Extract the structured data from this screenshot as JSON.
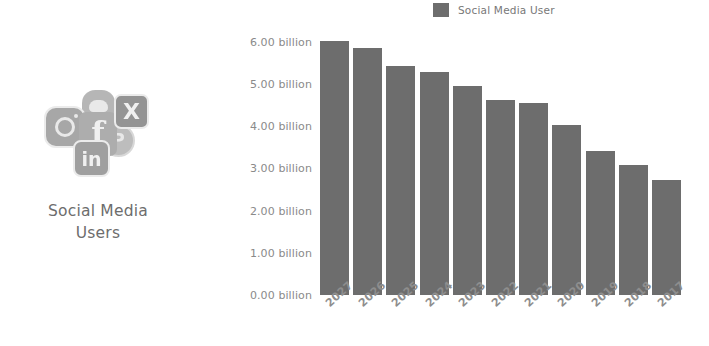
{
  "left_panel": {
    "caption_line1": "Social Media",
    "caption_line2": "Users",
    "icons": [
      {
        "name": "instagram-icon",
        "glyph": ""
      },
      {
        "name": "facebook-icon",
        "glyph": "f"
      },
      {
        "name": "snapchat-icon",
        "glyph": ""
      },
      {
        "name": "x-twitter-icon",
        "glyph": "X"
      },
      {
        "name": "linkedin-icon",
        "glyph": "in"
      },
      {
        "name": "pinterest-icon",
        "glyph": "P"
      }
    ]
  },
  "legend": {
    "label": "Social Media User",
    "swatch_color": "#6d6d6d",
    "position": "top-center"
  },
  "colors": {
    "bar": "#6d6d6d",
    "axis_text": "#8a8a8a",
    "background": "#ffffff",
    "caption_text": "#6d6d6d"
  },
  "chart_data": {
    "type": "bar",
    "title": "",
    "subtitle": "",
    "xlabel": "",
    "ylabel": "",
    "categories": [
      "2027",
      "2026",
      "2025",
      "2024",
      "2023",
      "2022",
      "2021",
      "2020",
      "2019",
      "2018",
      "2017"
    ],
    "values": [
      6.02,
      5.85,
      5.43,
      5.28,
      4.95,
      4.62,
      4.55,
      4.02,
      3.42,
      3.07,
      2.73
    ],
    "unit": "billion",
    "series": [
      {
        "name": "Social Media User",
        "values": [
          6.02,
          5.85,
          5.43,
          5.28,
          4.95,
          4.62,
          4.55,
          4.02,
          3.42,
          3.07,
          2.73
        ]
      }
    ],
    "ylim": [
      0,
      6
    ],
    "yticks": [
      6,
      5,
      4,
      3,
      2,
      1,
      0
    ],
    "ytick_labels": [
      "6.00 billion",
      "5.00 billion",
      "4.00 billion",
      "3.00 billion",
      "2.00 billion",
      "1.00 billion",
      "0.00 billion"
    ],
    "grid": false,
    "legend_position": "top-center",
    "xtick_rotation": -42
  }
}
